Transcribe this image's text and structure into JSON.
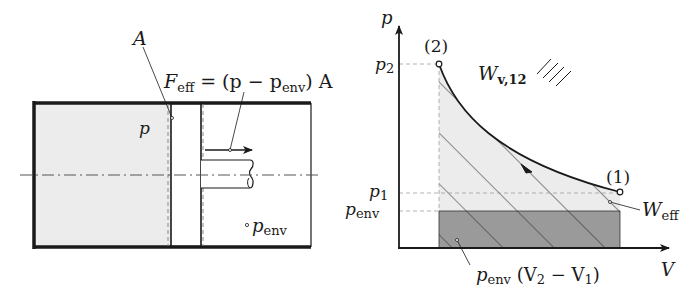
{
  "left_figure": {
    "title": "Piston-cylinder with effective force",
    "label_area": "A",
    "label_pressure": "p",
    "label_env_pressure_base": "p",
    "label_env_pressure_sub": "env",
    "force_equation": {
      "lhs_base": "F",
      "lhs_sub": "eff",
      "eq": " = (p − p",
      "p_sub": "env",
      "rhs_tail": ") A"
    }
  },
  "right_figure": {
    "title": "p-V diagram",
    "y_axis_label": "p",
    "x_axis_label": "V",
    "tick_p2_base": "p",
    "tick_p2_sub": "2",
    "tick_p1_base": "p",
    "tick_p1_sub": "1",
    "tick_penv_base": "p",
    "tick_penv_sub": "env",
    "state_2_label": "(2)",
    "state_1_label": "(1)",
    "work_legend_base": "W",
    "work_legend_sub": "v,12",
    "eff_work_base": "W",
    "eff_work_sub": "eff",
    "env_work_base": "p",
    "env_work_sub": "env",
    "env_work_tail_open": " (V",
    "env_work_v2_sub": "2",
    "env_work_minus": " − V",
    "env_work_v1_sub": "1",
    "env_work_close": ")"
  },
  "colors": {
    "line": "#1a1a1a",
    "gas_fill": "#ececec",
    "env_work_fill": "#9a9a9a",
    "dashed": "#a0a0a0"
  }
}
